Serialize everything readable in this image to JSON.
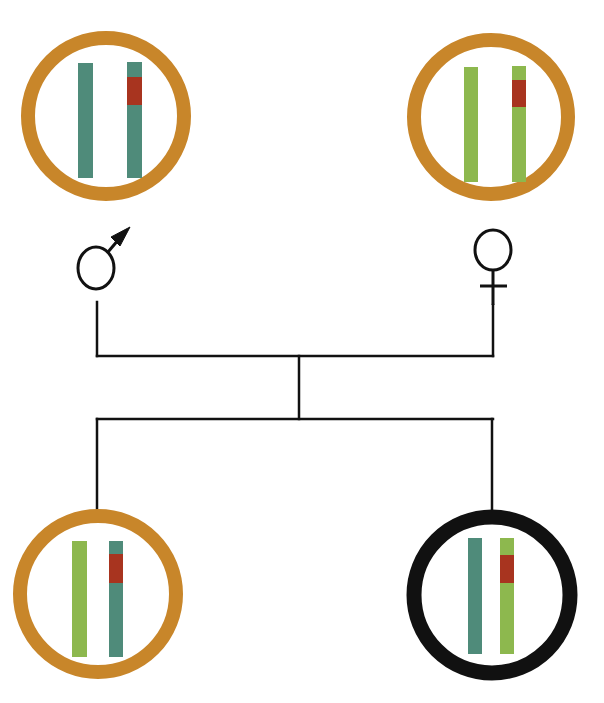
{
  "colors": {
    "ring_unaffected": "#C8862A",
    "ring_affected": "#111111",
    "chromosome_teal": "#4F8B7A",
    "chromosome_green": "#8DB84E",
    "segment_red": "#A8341F",
    "line": "#111111",
    "background": "#FFFFFF"
  },
  "parents": {
    "father": {
      "symbol": "♂",
      "symbol_name": "male-symbol",
      "ring": "unaffected",
      "circle": {
        "cx": 106,
        "cy": 116,
        "r": 78,
        "stroke": 14
      },
      "chromosomes": [
        {
          "x": 78,
          "y": 63,
          "w": 15,
          "h": 115,
          "color": "teal",
          "segment": null
        },
        {
          "x": 127,
          "y": 62,
          "w": 15,
          "h": 116,
          "color": "teal",
          "segment": {
            "y": 77,
            "h": 28
          }
        }
      ]
    },
    "mother": {
      "symbol": "♀",
      "symbol_name": "female-symbol",
      "ring": "unaffected",
      "circle": {
        "cx": 491,
        "cy": 117,
        "r": 77,
        "stroke": 14
      },
      "chromosomes": [
        {
          "x": 464,
          "y": 67,
          "w": 14,
          "h": 115,
          "color": "green",
          "segment": null
        },
        {
          "x": 512,
          "y": 66,
          "w": 14,
          "h": 116,
          "color": "green",
          "segment": {
            "y": 80,
            "h": 27
          }
        }
      ]
    }
  },
  "children": [
    {
      "label": "child-1",
      "ring": "unaffected",
      "circle": {
        "cx": 98,
        "cy": 594,
        "r": 78,
        "stroke": 14
      },
      "chromosomes": [
        {
          "x": 72,
          "y": 541,
          "w": 15,
          "h": 116,
          "color": "green",
          "segment": null
        },
        {
          "x": 109,
          "y": 541,
          "w": 14,
          "h": 116,
          "color": "teal",
          "segment": {
            "y": 554,
            "h": 29
          }
        }
      ]
    },
    {
      "label": "child-2",
      "ring": "affected",
      "circle": {
        "cx": 492,
        "cy": 595,
        "r": 78,
        "stroke": 15
      },
      "chromosomes": [
        {
          "x": 468,
          "y": 538,
          "w": 14,
          "h": 116,
          "color": "teal",
          "segment": null
        },
        {
          "x": 500,
          "y": 538,
          "w": 14,
          "h": 116,
          "color": "green",
          "segment": {
            "y": 555,
            "h": 28
          }
        }
      ]
    }
  ],
  "lines": {
    "father_drop": {
      "x": 97,
      "y1": 302,
      "y2": 356
    },
    "mother_drop": {
      "x": 493,
      "y1": 305,
      "y2": 356
    },
    "mating_line": {
      "y": 356,
      "x1": 97,
      "x2": 493
    },
    "descent_line": {
      "x": 299,
      "y1": 356,
      "y2": 419
    },
    "sibship_line": {
      "y": 419,
      "x1": 97,
      "x2": 493
    },
    "child1_drop": {
      "x": 97,
      "y1": 419,
      "y2": 509
    },
    "child2_drop": {
      "x": 492,
      "y1": 419,
      "y2": 510
    }
  }
}
